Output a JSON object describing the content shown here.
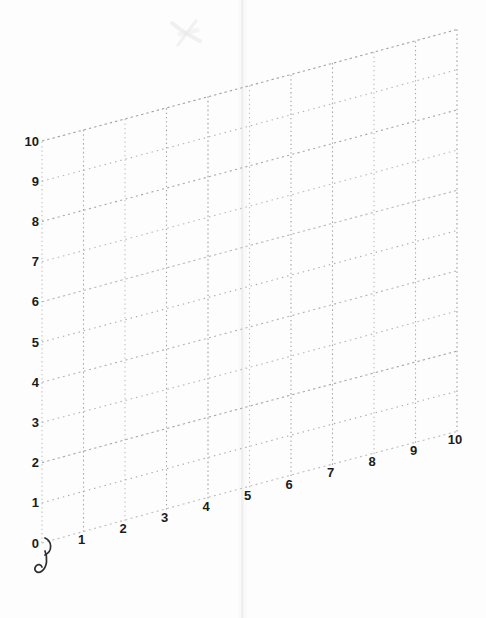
{
  "page": {
    "background_color": "#fdfdfd"
  },
  "chart_data": {
    "type": "line",
    "title": "",
    "subtitle": "",
    "xlabel": "",
    "ylabel": "",
    "legend": [],
    "series": [],
    "grid": true,
    "grid_style": "dotted",
    "projection": "oblique sheared parallelogram, x-axis rising to the right",
    "xlim": [
      0,
      10
    ],
    "ylim": [
      0,
      10
    ],
    "x_step": 1,
    "y_step": 1,
    "x_tick_labels": [
      "1",
      "2",
      "3",
      "4",
      "5",
      "6",
      "7",
      "8",
      "9",
      "10"
    ],
    "y_tick_labels": [
      "10",
      "9",
      "8",
      "7",
      "6",
      "5",
      "4",
      "3",
      "2",
      "1",
      "0"
    ],
    "colors": {
      "grid_line_horizontal": "#a0a0a0",
      "grid_line_vertical": "#9d9d9d",
      "tick_label": "#1b1b1b",
      "pen_mark": "#2d2d2d",
      "scan_artifact": "#e9e9e9"
    },
    "annotations": [
      {
        "name": "origin-pen-squiggle",
        "description": "handwritten J-shaped pen curl next to the origin 0 label"
      },
      {
        "name": "scan-smudge",
        "description": "faint gray smudge near top centre of the page"
      },
      {
        "name": "scan-fold-line",
        "description": "faint vertical fold / scan line down the centre of the page"
      }
    ]
  }
}
